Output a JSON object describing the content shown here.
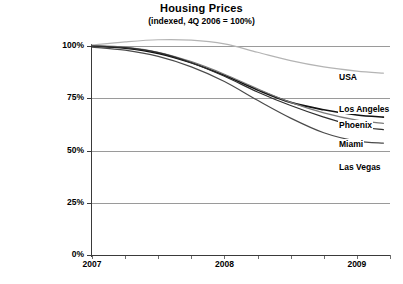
{
  "chart_data": {
    "type": "line",
    "title": "Housing Prices",
    "subtitle": "(indexed, 4Q 2006 = 100%)",
    "xlabel": "",
    "ylabel": "",
    "ylim": [
      0,
      100
    ],
    "xlim": [
      2007,
      2009.25
    ],
    "grid": true,
    "legend_position": "right-inline-labels",
    "y_ticks": [
      "0%",
      "25%",
      "50%",
      "75%",
      "100%"
    ],
    "y_tick_values": [
      0,
      25,
      50,
      75,
      100
    ],
    "x_ticks": [
      "2007",
      "2008",
      "2009"
    ],
    "x_tick_values": [
      2007,
      2008,
      2009
    ],
    "x_minor_ticks": [
      2007.25,
      2007.5,
      2007.75,
      2008.25,
      2008.5,
      2008.75,
      2009.25
    ],
    "x": [
      2007.0,
      2007.25,
      2007.5,
      2007.75,
      2008.0,
      2008.25,
      2008.5,
      2008.75,
      2009.0,
      2009.2
    ],
    "series": [
      {
        "name": "USA",
        "color": "#b4b4b4",
        "values": [
          100.5,
          102.0,
          103.0,
          102.8,
          101.0,
          97.0,
          93.0,
          90.0,
          88.0,
          87.0
        ]
      },
      {
        "name": "Los Angeles",
        "color": "#111111",
        "values": [
          100.0,
          99.0,
          96.5,
          92.0,
          86.0,
          79.0,
          73.0,
          69.5,
          67.0,
          66.0
        ]
      },
      {
        "name": "Phoenix",
        "color": "#7a7a7a",
        "values": [
          100.2,
          99.5,
          97.0,
          92.5,
          86.5,
          79.5,
          73.0,
          68.0,
          64.5,
          63.0
        ]
      },
      {
        "name": "Miami",
        "color": "#2e2e2e",
        "values": [
          100.0,
          99.2,
          96.8,
          92.0,
          85.5,
          78.0,
          71.5,
          66.0,
          61.5,
          60.0
        ]
      },
      {
        "name": "Las Vegas",
        "color": "#4a4a4a",
        "values": [
          99.5,
          98.0,
          95.0,
          90.0,
          83.0,
          74.0,
          65.5,
          58.5,
          54.5,
          53.5
        ]
      }
    ],
    "annotations": [
      {
        "text": "USA",
        "x": 338,
        "y": 72
      },
      {
        "text": "Los Angeles",
        "x": 338,
        "y": 104
      },
      {
        "text": "Phoenix",
        "x": 338,
        "y": 120
      },
      {
        "text": "Miami",
        "x": 338,
        "y": 139
      },
      {
        "text": "Las Vegas",
        "x": 338,
        "y": 162
      }
    ],
    "source_note": ""
  }
}
